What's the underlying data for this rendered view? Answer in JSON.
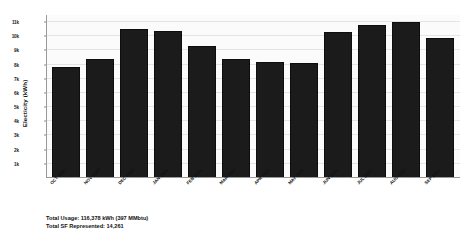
{
  "chart_data": {
    "type": "bar",
    "title": "",
    "xlabel": "",
    "ylabel": "Electicity (kWh)",
    "categories": [
      "OCT 2020",
      "NOV 2020",
      "DEC 2020",
      "JAN 2021",
      "FEB 2021",
      "MAR 2021",
      "APR 2021",
      "MAY 2021",
      "JUN 2021",
      "JUL 2021",
      "AUG 2021",
      "SEP 2021"
    ],
    "values": [
      7800,
      8400,
      10500,
      10400,
      9300,
      8400,
      8200,
      8100,
      10300,
      10800,
      11000,
      9900
    ],
    "ylim": [
      0,
      11500
    ],
    "yticks": [
      1000,
      2000,
      3000,
      4000,
      5000,
      6000,
      7000,
      8000,
      9000,
      10000,
      11000
    ],
    "ytick_labels": [
      "1k",
      "2k",
      "3k",
      "4k",
      "5k",
      "6k",
      "7k",
      "8k",
      "9k",
      "10k",
      "11k"
    ],
    "grid": true,
    "legend": "none",
    "bar_color": "#1b1b1b"
  },
  "footer": {
    "total_usage": "Total Usage: 116,378 kWh (397 MMbtu)",
    "total_sf": "Total SF Represented: 14,261"
  }
}
